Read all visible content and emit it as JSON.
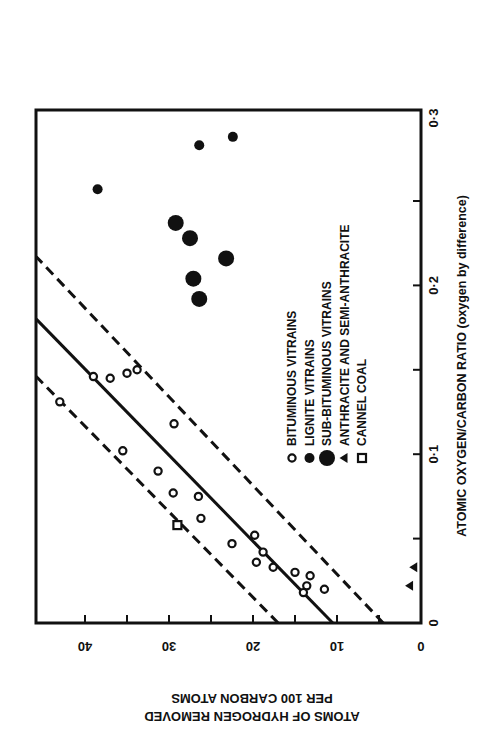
{
  "figure": {
    "orientation": "rotated 90 degrees counter-clockwise",
    "ink_color": "#111111",
    "background": "#ffffff"
  },
  "chart_data": {
    "type": "scatter",
    "title": "",
    "xlabel": "ATOMIC OXYGEN/CARBON RATIO (oxygen by difference)",
    "ylabel": "ATOMS OF HYDROGEN REMOVED PER 100 CARBON ATOMS",
    "ylabel_lines": [
      "ATOMS OF HYDROGEN REMOVED",
      "PER 100 CARBON ATOMS"
    ],
    "xlim": [
      0,
      0.3
    ],
    "ylim": [
      0,
      46
    ],
    "x_ticks": [
      0,
      0.05,
      0.1,
      0.15,
      0.2,
      0.25,
      0.3
    ],
    "x_tick_labels": [
      "0",
      "",
      "0·1",
      "",
      "0·2",
      "",
      "0·3"
    ],
    "y_ticks": [
      0,
      5,
      10,
      15,
      20,
      25,
      30,
      35,
      40
    ],
    "y_tick_labels": [
      "0",
      "",
      "10",
      "",
      "20",
      "",
      "30",
      "",
      "40"
    ],
    "grid": false,
    "legend_position": "inside, center-right",
    "legend": [
      {
        "marker": "open-circle-small",
        "label": "BITUMINOUS VITRAINS"
      },
      {
        "marker": "filled-circle-small",
        "label": "LIGNITE VITRAINS"
      },
      {
        "marker": "filled-circle-large",
        "label": "SUB-BITUMINOUS VITRAINS"
      },
      {
        "marker": "filled-triangle",
        "label": "ANTHRACITE AND SEMI-ANTHRACITE"
      },
      {
        "marker": "open-square",
        "label": "CANNEL COAL"
      }
    ],
    "series": [
      {
        "name": "BITUMINOUS VITRAINS",
        "marker": "open-circle-small",
        "points": [
          [
            0.131,
            43.0
          ],
          [
            0.146,
            39.0
          ],
          [
            0.145,
            37.0
          ],
          [
            0.148,
            35.0
          ],
          [
            0.15,
            33.8
          ],
          [
            0.118,
            29.4
          ],
          [
            0.102,
            35.5
          ],
          [
            0.09,
            31.3
          ],
          [
            0.077,
            29.5
          ],
          [
            0.075,
            26.5
          ],
          [
            0.062,
            26.2
          ],
          [
            0.047,
            22.5
          ],
          [
            0.052,
            19.8
          ],
          [
            0.036,
            19.6
          ],
          [
            0.042,
            18.8
          ],
          [
            0.033,
            17.6
          ],
          [
            0.03,
            15.0
          ],
          [
            0.028,
            13.2
          ],
          [
            0.022,
            13.6
          ],
          [
            0.018,
            14.0
          ],
          [
            0.02,
            11.5
          ]
        ]
      },
      {
        "name": "LIGNITE VITRAINS",
        "marker": "filled-circle-small",
        "points": [
          [
            0.257,
            38.5
          ],
          [
            0.283,
            26.4
          ],
          [
            0.288,
            22.4
          ]
        ]
      },
      {
        "name": "SUB-BITUMINOUS VITRAINS",
        "marker": "filled-circle-large",
        "points": [
          [
            0.237,
            29.2
          ],
          [
            0.228,
            27.5
          ],
          [
            0.216,
            23.2
          ],
          [
            0.204,
            27.1
          ],
          [
            0.192,
            26.4
          ]
        ]
      },
      {
        "name": "ANTHRACITE AND SEMI-ANTHRACITE",
        "marker": "filled-triangle",
        "points": [
          [
            0.033,
            0.8
          ],
          [
            0.022,
            1.3
          ]
        ]
      },
      {
        "name": "CANNEL COAL",
        "marker": "open-square",
        "points": [
          [
            0.058,
            29.0
          ]
        ]
      }
    ],
    "lines": [
      {
        "name": "regression line",
        "style": "solid",
        "from": [
          0.0,
          10.5
        ],
        "to": [
          0.18,
          45.8
        ]
      },
      {
        "name": "upper bound",
        "style": "dashed",
        "from": [
          0.0,
          17.0
        ],
        "to": [
          0.146,
          45.8
        ]
      },
      {
        "name": "lower bound",
        "style": "dashed",
        "from": [
          0.0,
          4.5
        ],
        "to": [
          0.217,
          45.8
        ]
      }
    ]
  }
}
